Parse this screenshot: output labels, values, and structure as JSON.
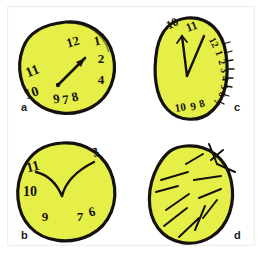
{
  "figure": {
    "background_color": "#ffffff",
    "ink_color": "#15120e",
    "clock_fill_color": "#e6ef47",
    "frame_color": "#f0f0f0"
  },
  "panels": [
    {
      "id": "a",
      "label": "a",
      "label_x": 21,
      "label_y": 108,
      "description": "Clock with numerals crowded to the right side and an arrow-shaped single hand pointing toward 1",
      "has_numbers": true,
      "hands": "single arrow hand pointing up-right toward the 1",
      "numbers": [
        {
          "text": "12",
          "x": 74,
          "y": 46,
          "rotate": -16,
          "size": 13
        },
        {
          "text": "1",
          "x": 98,
          "y": 45,
          "rotate": -12,
          "size": 13
        },
        {
          "text": "2",
          "x": 101,
          "y": 63,
          "rotate": 0,
          "size": 13
        },
        {
          "text": "4",
          "x": 101,
          "y": 84,
          "rotate": 0,
          "size": 13
        },
        {
          "text": "11",
          "x": 34,
          "y": 75,
          "rotate": -22,
          "size": 14
        },
        {
          "text": "10",
          "x": 33,
          "y": 97,
          "rotate": -18,
          "size": 14
        },
        {
          "text": "9",
          "x": 57,
          "y": 103,
          "rotate": -8,
          "size": 13
        },
        {
          "text": "7",
          "x": 66,
          "y": 104,
          "rotate": -6,
          "size": 13
        },
        {
          "text": "8",
          "x": 76,
          "y": 101,
          "rotate": -14,
          "size": 13
        }
      ]
    },
    {
      "id": "b",
      "label": "b",
      "label_x": 21,
      "label_y": 235,
      "description": "Clock with only a few numerals and two short curved hands drawn from the centre",
      "has_numbers": true,
      "hands": "two curved hands forming a V toward 11 and 3",
      "numbers": [
        {
          "text": "3",
          "x": 97,
          "y": 156,
          "rotate": -22,
          "size": 13
        },
        {
          "text": "11",
          "x": 34,
          "y": 171,
          "rotate": -14,
          "size": 14
        },
        {
          "text": "10",
          "x": 30,
          "y": 196,
          "rotate": 0,
          "size": 14
        },
        {
          "text": "9",
          "x": 45,
          "y": 221,
          "rotate": 0,
          "size": 13
        },
        {
          "text": "7",
          "x": 80,
          "y": 221,
          "rotate": 0,
          "size": 13
        },
        {
          "text": "6",
          "x": 93,
          "y": 216,
          "rotate": -14,
          "size": 13
        }
      ]
    },
    {
      "id": "c",
      "label": "c",
      "label_x": 234,
      "label_y": 108,
      "description": "Oval clock with all numerals compressed along the right-hand edge and two hands near 12",
      "has_numbers": true,
      "hands": "two straight hands forming a narrow V pointing up",
      "numbers": [
        {
          "text": "10",
          "x": 174,
          "y": 27,
          "rotate": -28,
          "size": 12
        },
        {
          "text": "11",
          "x": 193,
          "y": 30,
          "rotate": -22,
          "size": 12
        },
        {
          "text": "12",
          "x": 211,
          "y": 44,
          "rotate": 62,
          "size": 10
        },
        {
          "text": "1",
          "x": 216,
          "y": 54,
          "rotate": 70,
          "size": 10
        },
        {
          "text": "2",
          "x": 219,
          "y": 63,
          "rotate": 74,
          "size": 10
        },
        {
          "text": "3",
          "x": 221,
          "y": 71,
          "rotate": 78,
          "size": 10
        },
        {
          "text": "4",
          "x": 222,
          "y": 79,
          "rotate": 80,
          "size": 10
        },
        {
          "text": "5",
          "x": 221,
          "y": 87,
          "rotate": 84,
          "size": 10
        },
        {
          "text": "6",
          "x": 219,
          "y": 94,
          "rotate": 96,
          "size": 10
        },
        {
          "text": "7",
          "x": 214,
          "y": 101,
          "rotate": 110,
          "size": 10
        },
        {
          "text": "10",
          "x": 181,
          "y": 111,
          "rotate": -10,
          "size": 11
        },
        {
          "text": "9",
          "x": 194,
          "y": 110,
          "rotate": -12,
          "size": 11
        },
        {
          "text": "8",
          "x": 203,
          "y": 107,
          "rotate": -16,
          "size": 11
        }
      ]
    },
    {
      "id": "d",
      "label": "d",
      "label_x": 234,
      "label_y": 235,
      "description": "Clock outline containing no numerals, only scattered short strokes and crossing lines at the rim",
      "has_numbers": false,
      "hands": "many scattered short strokes, no numerals",
      "numbers": []
    }
  ]
}
